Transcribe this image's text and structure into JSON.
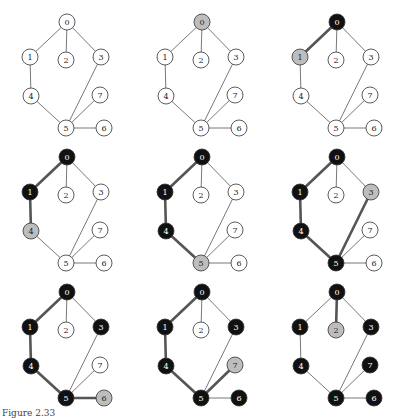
{
  "figure": {
    "caption": "Figure 2.33",
    "colors": {
      "unvisited_fill": "#ffffff",
      "frontier_fill": "#bdbdbd",
      "visited_fill": "#111111",
      "thin_edge": "#555555",
      "thick_edge": "#555555",
      "node_stroke": "#333333"
    },
    "nodes": [
      {
        "id": "0",
        "x": 67,
        "y": 22
      },
      {
        "id": "1",
        "x": 30,
        "y": 57
      },
      {
        "id": "2",
        "x": 66,
        "y": 60
      },
      {
        "id": "3",
        "x": 101,
        "y": 57
      },
      {
        "id": "4",
        "x": 31,
        "y": 96
      },
      {
        "id": "5",
        "x": 66,
        "y": 128
      },
      {
        "id": "6",
        "x": 104,
        "y": 128
      },
      {
        "id": "7",
        "x": 100,
        "y": 95
      }
    ],
    "edges": [
      [
        "0",
        "1"
      ],
      [
        "0",
        "2"
      ],
      [
        "0",
        "3"
      ],
      [
        "1",
        "4"
      ],
      [
        "4",
        "5"
      ],
      [
        "3",
        "5"
      ],
      [
        "5",
        "7"
      ],
      [
        "5",
        "6"
      ]
    ],
    "panels": [
      {
        "x": 0,
        "y": 0,
        "visited": [],
        "frontier": [],
        "thick": []
      },
      {
        "x": 135,
        "y": 0,
        "visited": [],
        "frontier": [
          "0"
        ],
        "thick": []
      },
      {
        "x": 270,
        "y": 0,
        "visited": [
          "0"
        ],
        "frontier": [
          "1"
        ],
        "thick": [
          [
            "0",
            "1"
          ]
        ]
      },
      {
        "x": 0,
        "y": 135,
        "visited": [
          "0",
          "1"
        ],
        "frontier": [
          "4"
        ],
        "thick": [
          [
            "0",
            "1"
          ],
          [
            "1",
            "4"
          ]
        ]
      },
      {
        "x": 135,
        "y": 135,
        "visited": [
          "0",
          "1",
          "4"
        ],
        "frontier": [
          "5"
        ],
        "thick": [
          [
            "0",
            "1"
          ],
          [
            "1",
            "4"
          ],
          [
            "4",
            "5"
          ]
        ]
      },
      {
        "x": 270,
        "y": 135,
        "visited": [
          "0",
          "1",
          "4",
          "5"
        ],
        "frontier": [
          "3"
        ],
        "thick": [
          [
            "0",
            "1"
          ],
          [
            "1",
            "4"
          ],
          [
            "4",
            "5"
          ],
          [
            "3",
            "5"
          ]
        ]
      },
      {
        "x": 0,
        "y": 270,
        "visited": [
          "0",
          "1",
          "3",
          "4",
          "5"
        ],
        "frontier": [
          "6"
        ],
        "thick": [
          [
            "0",
            "1"
          ],
          [
            "1",
            "4"
          ],
          [
            "4",
            "5"
          ],
          [
            "5",
            "6"
          ]
        ]
      },
      {
        "x": 135,
        "y": 270,
        "visited": [
          "0",
          "1",
          "3",
          "4",
          "5",
          "6"
        ],
        "frontier": [
          "7"
        ],
        "thick": [
          [
            "0",
            "1"
          ],
          [
            "1",
            "4"
          ],
          [
            "4",
            "5"
          ],
          [
            "5",
            "7"
          ]
        ]
      },
      {
        "x": 270,
        "y": 270,
        "visited": [
          "0",
          "1",
          "3",
          "4",
          "5",
          "6",
          "7"
        ],
        "frontier": [
          "2"
        ],
        "thick": [
          [
            "0",
            "2"
          ]
        ]
      }
    ]
  }
}
